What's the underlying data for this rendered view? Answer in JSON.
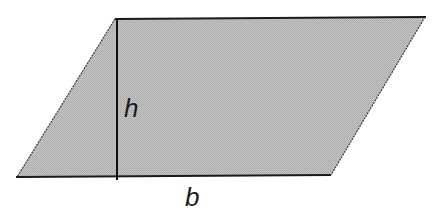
{
  "diagram": {
    "shape": "parallelogram",
    "fill_color": "#bdbdbd",
    "stroke_color": "#1a1a1a",
    "vertices": {
      "top_left": [
        115,
        19
      ],
      "top_right": [
        425,
        17
      ],
      "bottom_right": [
        331,
        175
      ],
      "bottom_left": [
        17,
        177
      ]
    },
    "height_line": {
      "x": 117,
      "y1": 19,
      "y2": 180
    },
    "labels": {
      "height": "h",
      "base": "b"
    }
  }
}
